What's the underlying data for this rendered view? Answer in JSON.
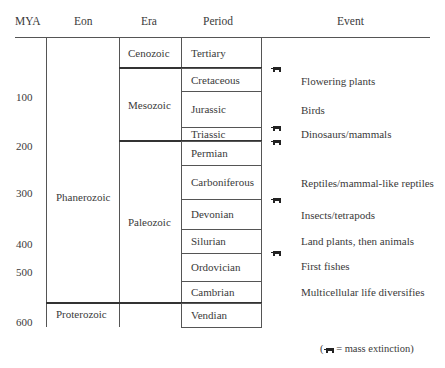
{
  "headers": {
    "mya": "MYA",
    "eon": "Eon",
    "era": "Era",
    "period": "Period",
    "event": "Event"
  },
  "mya_ticks": [
    {
      "label": "100",
      "y": 98
    },
    {
      "label": "200",
      "y": 147
    },
    {
      "label": "300",
      "y": 194
    },
    {
      "label": "400",
      "y": 245
    },
    {
      "label": "500",
      "y": 273
    },
    {
      "label": "600",
      "y": 323
    }
  ],
  "eons": [
    {
      "name": "Phanerozoic",
      "top": 37,
      "bottom": 303
    },
    {
      "name": "Proterozoic",
      "top": 303,
      "bottom": 327
    }
  ],
  "eras": [
    {
      "name": "Cenozoic",
      "top": 37,
      "bottom": 68
    },
    {
      "name": "Mesozoic",
      "top": 68,
      "bottom": 141
    },
    {
      "name": "Paleozoic",
      "top": 141,
      "bottom": 303
    },
    {
      "name": "",
      "top": 303,
      "bottom": 327
    }
  ],
  "periods": [
    {
      "name": "Tertiary",
      "top": 37,
      "bottom": 68
    },
    {
      "name": "Cretaceous",
      "top": 68,
      "bottom": 91
    },
    {
      "name": "Jurassic",
      "top": 91,
      "bottom": 127
    },
    {
      "name": "Triassic",
      "top": 127,
      "bottom": 141
    },
    {
      "name": "Permian",
      "top": 141,
      "bottom": 165
    },
    {
      "name": "Carboniferous",
      "top": 165,
      "bottom": 199
    },
    {
      "name": "Devonian",
      "top": 199,
      "bottom": 229
    },
    {
      "name": "Silurian",
      "top": 229,
      "bottom": 253
    },
    {
      "name": "Ordovician",
      "top": 253,
      "bottom": 281
    },
    {
      "name": "Cambrian",
      "top": 281,
      "bottom": 303
    },
    {
      "name": "Vendian",
      "top": 303,
      "bottom": 327
    }
  ],
  "events": [
    {
      "label": "Flowering plants",
      "y": 75
    },
    {
      "label": "Birds",
      "y": 104
    },
    {
      "label": "Dinosaurs/mammals",
      "y": 128
    },
    {
      "label": "Reptiles/mammal-like reptiles",
      "y": 177
    },
    {
      "label": "Insects/tetrapods",
      "y": 209
    },
    {
      "label": "Land plants, then animals",
      "y": 235
    },
    {
      "label": "First fishes",
      "y": 260
    },
    {
      "label": "Multicellular life diversifies",
      "y": 286
    }
  ],
  "extinctions": [
    {
      "name": "mass-extinction-end-cretaceous",
      "y": 67
    },
    {
      "name": "mass-extinction-end-triassic",
      "y": 126
    },
    {
      "name": "mass-extinction-end-permian",
      "y": 140
    },
    {
      "name": "mass-extinction-late-devonian",
      "y": 198
    },
    {
      "name": "mass-extinction-end-ordovician",
      "y": 251
    }
  ],
  "legend": {
    "text": "= mass extinction)",
    "open": "("
  }
}
